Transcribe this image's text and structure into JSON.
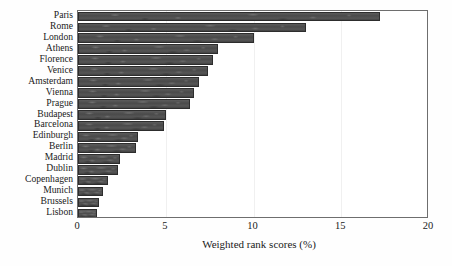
{
  "chart_data": {
    "type": "bar",
    "orientation": "horizontal",
    "title": "",
    "subtitle": "",
    "xlabel": "Weighted rank scores (%)",
    "ylabel": "",
    "xlim": [
      0,
      20
    ],
    "xticks": [
      "0",
      "5",
      "10",
      "15",
      "20"
    ],
    "xtick_values": [
      0,
      5,
      10,
      15,
      20
    ],
    "grid": false,
    "legend": null,
    "legend_position": "none",
    "bar_color": "#4f4f4f",
    "bar_edge_color": "#2d2d2d",
    "frame_color": "#6e6e6e",
    "background": "#ffffff",
    "categories": [
      "Paris",
      "Rome",
      "London",
      "Athens",
      "Florence",
      "Venice",
      "Amsterdam",
      "Vienna",
      "Prague",
      "Budapest",
      "Barcelona",
      "Edinburgh",
      "Berlin",
      "Madrid",
      "Dublin",
      "Copenhagen",
      "Munich",
      "Brussels",
      "Lisbon"
    ],
    "values": [
      17.2,
      13.0,
      10.0,
      8.0,
      7.7,
      7.4,
      6.9,
      6.6,
      6.4,
      5.0,
      4.9,
      3.4,
      3.3,
      2.4,
      2.3,
      1.7,
      1.4,
      1.2,
      1.1
    ]
  }
}
